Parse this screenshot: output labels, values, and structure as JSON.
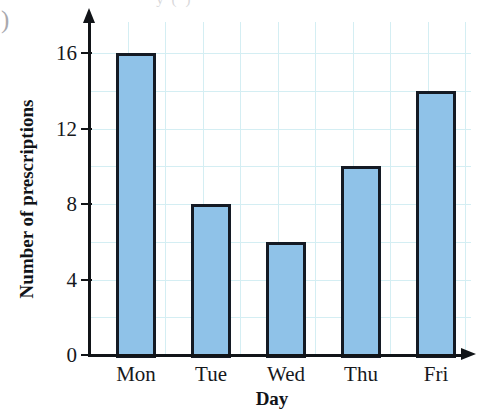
{
  "page": {
    "top_caption_remnant": "· · ·  y  (·)  ·",
    "left_margin_marker": ")"
  },
  "chart_data": {
    "type": "bar",
    "title": "",
    "categories": [
      "Mon",
      "Tue",
      "Wed",
      "Thu",
      "Fri"
    ],
    "values": [
      16,
      8,
      6,
      10,
      14
    ],
    "xlabel": "Day",
    "ylabel": "Number of prescriptions",
    "ylim": [
      0,
      17
    ],
    "yticks": [
      0,
      4,
      8,
      12,
      16
    ],
    "ytick_labels": [
      "0",
      "4",
      "8",
      "12",
      "16"
    ],
    "grid": true,
    "grid_color": "#d4eef3",
    "bar_color": "#8fc2e8",
    "bar_edge_color": "#141a24",
    "axis_color": "#111418",
    "legend": null
  }
}
